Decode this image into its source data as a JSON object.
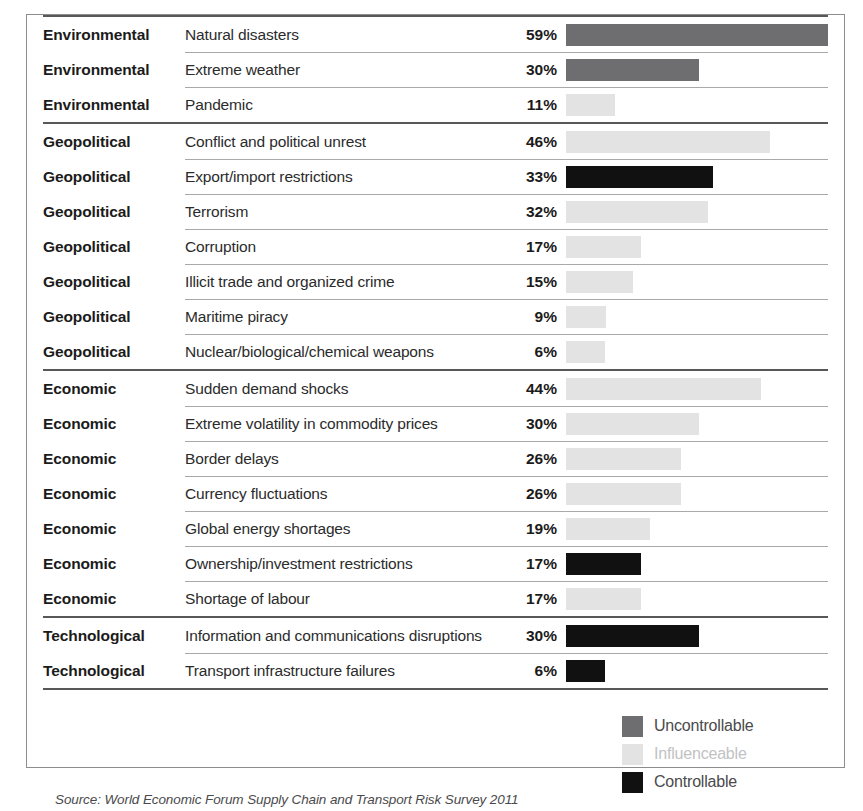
{
  "figure": {
    "source_note": "Source: World Economic Forum Supply Chain and Transport Risk Survey 2011",
    "colors": {
      "uncontrollable": "#6e6e70",
      "influenceable": "#e3e3e4",
      "controllable": "#111111",
      "section_rule": "#58585a",
      "row_rule": "#a9a9ab",
      "border": "#8d8d8d",
      "text": "#2b2b2b",
      "influenceable_text": "#c2c2c4"
    }
  },
  "legend": {
    "items": [
      {
        "label": "Uncontrollable",
        "color": "#6e6e70",
        "text_color": "#4a4a4c"
      },
      {
        "label": "Influenceable",
        "color": "#e3e3e4",
        "text_color": "#c2c2c4"
      },
      {
        "label": "Controllable",
        "color": "#111111",
        "text_color": "#4a4a4c"
      }
    ]
  },
  "chart_data": {
    "type": "bar",
    "title": "",
    "xlabel": "",
    "ylabel": "",
    "xlim": [
      0,
      59
    ],
    "orientation": "horizontal",
    "grid": false,
    "legend_position": "bottom-right",
    "value_suffix": "%",
    "legend_entries": [
      "Uncontrollable",
      "Influenceable",
      "Controllable"
    ],
    "categories": [
      "Environmental",
      "Geopolitical",
      "Economic",
      "Technological"
    ],
    "sections": [
      {
        "category": "Environmental",
        "rows": [
          {
            "label": "Natural disasters",
            "value": 59,
            "value_label": "59%",
            "type": "uncontrollable"
          },
          {
            "label": "Extreme weather",
            "value": 30,
            "value_label": "30%",
            "type": "uncontrollable"
          },
          {
            "label": "Pandemic",
            "value": 11,
            "value_label": "11%",
            "type": "influenceable"
          }
        ]
      },
      {
        "category": "Geopolitical",
        "rows": [
          {
            "label": "Conflict and political unrest",
            "value": 46,
            "value_label": "46%",
            "type": "influenceable"
          },
          {
            "label": "Export/import restrictions",
            "value": 33,
            "value_label": "33%",
            "type": "controllable"
          },
          {
            "label": "Terrorism",
            "value": 32,
            "value_label": "32%",
            "type": "influenceable"
          },
          {
            "label": "Corruption",
            "value": 17,
            "value_label": "17%",
            "type": "influenceable"
          },
          {
            "label": "Illicit trade and organized crime",
            "value": 15,
            "value_label": "15%",
            "type": "influenceable"
          },
          {
            "label": "Maritime piracy",
            "value": 9,
            "value_label": "9%",
            "type": "influenceable"
          },
          {
            "label": "Nuclear/biological/chemical weapons",
            "value": 6,
            "value_label": "6%",
            "type": "influenceable"
          }
        ]
      },
      {
        "category": "Economic",
        "rows": [
          {
            "label": "Sudden demand shocks",
            "value": 44,
            "value_label": "44%",
            "type": "influenceable"
          },
          {
            "label": "Extreme volatility in commodity prices",
            "value": 30,
            "value_label": "30%",
            "type": "influenceable"
          },
          {
            "label": "Border delays",
            "value": 26,
            "value_label": "26%",
            "type": "influenceable"
          },
          {
            "label": "Currency fluctuations",
            "value": 26,
            "value_label": "26%",
            "type": "influenceable"
          },
          {
            "label": "Global energy shortages",
            "value": 19,
            "value_label": "19%",
            "type": "influenceable"
          },
          {
            "label": "Ownership/investment restrictions",
            "value": 17,
            "value_label": "17%",
            "type": "controllable"
          },
          {
            "label": "Shortage of labour",
            "value": 17,
            "value_label": "17%",
            "type": "influenceable"
          }
        ]
      },
      {
        "category": "Technological",
        "rows": [
          {
            "label": "Information and communications disruptions",
            "value": 30,
            "value_label": "30%",
            "type": "controllable"
          },
          {
            "label": "Transport infrastructure failures",
            "value": 6,
            "value_label": "6%",
            "type": "controllable"
          }
        ]
      }
    ]
  }
}
